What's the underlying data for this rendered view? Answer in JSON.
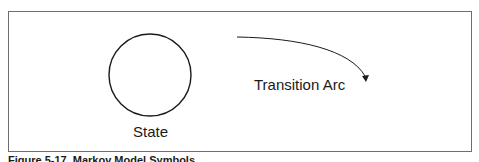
{
  "figure": {
    "caption": "Figure 5-17. Markov Model Symbols",
    "state_label": "State",
    "arc_label": "Transition Arc"
  },
  "colors": {
    "stroke": "#1a1a1a",
    "frame": "#6e6e6e",
    "background": "#ffffff"
  }
}
